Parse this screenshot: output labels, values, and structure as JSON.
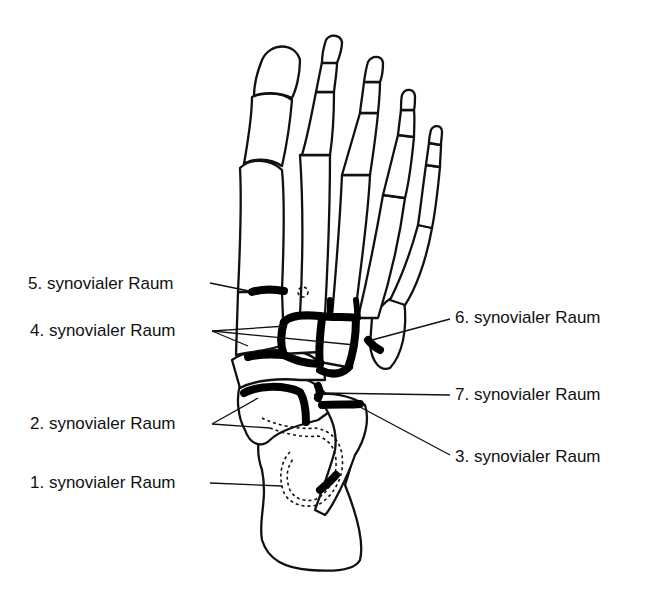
{
  "figure": {
    "colors": {
      "line": "#111111",
      "background": "#ffffff",
      "joint_fill": "#000000"
    }
  },
  "labels": {
    "l5": "5. synovialer Raum",
    "l4": "4. synovialer Raum",
    "l2": "2. synovialer Raum",
    "l1": "1. synovialer Raum",
    "l6": "6. synovialer Raum",
    "l7": "7. synovialer Raum",
    "l3": "3. synovialer Raum"
  }
}
